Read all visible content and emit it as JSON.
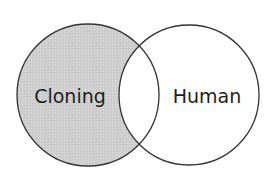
{
  "diagram": {
    "type": "venn",
    "sets": [
      {
        "id": "cloning",
        "label": "Cloning",
        "shaded": true,
        "shaded_region": "cloning-only",
        "fill": "#cfcfcf",
        "center": [
          88,
          95
        ],
        "radius": 71
      },
      {
        "id": "human",
        "label": "Human",
        "shaded": false,
        "fill": "#ffffff",
        "center": [
          189,
          95
        ],
        "radius": 70
      }
    ],
    "intersection": {
      "shaded": false,
      "fill": "#ffffff"
    },
    "stroke_color": "#333333",
    "background": "#ffffff"
  }
}
